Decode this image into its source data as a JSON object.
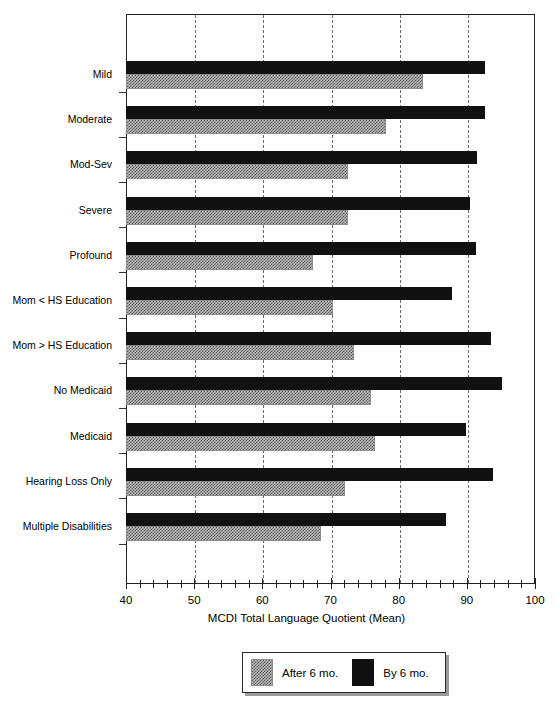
{
  "chart_data": {
    "type": "bar",
    "orientation": "horizontal",
    "title": "",
    "xlabel": "MCDI Total Language Quotient (Mean)",
    "ylabel": "",
    "xlim": [
      40,
      100
    ],
    "xticks": [
      40,
      50,
      60,
      70,
      80,
      90,
      100
    ],
    "xtick_labels": [
      "40",
      "50",
      "60",
      "70",
      "80",
      "90",
      "100"
    ],
    "minor_tick_step": 2,
    "grid": "vertical dashed at 50,60,70,80,90",
    "gridlines": [
      50,
      60,
      70,
      80,
      90
    ],
    "legend_position": "bottom-center",
    "categories": [
      "Mild",
      "Moderate",
      "Mod-Sev",
      "Severe",
      "Profound",
      "Mom < HS Education",
      "Mom > HS Education",
      "No Medicaid",
      "Medicaid",
      "Hearing Loss Only",
      "Multiple Disabilities"
    ],
    "series": [
      {
        "name": "By 6 mo.",
        "color": "#111111",
        "values": [
          92.6,
          92.6,
          91.5,
          90.4,
          91.4,
          87.8,
          93.6,
          95.1,
          89.9,
          93.8,
          86.9
        ]
      },
      {
        "name": "After 6 mo.",
        "color": "#b9b9b9",
        "values": [
          83.5,
          78.1,
          72.5,
          72.6,
          67.4,
          70.3,
          73.4,
          75.9,
          76.6,
          72.2,
          68.6
        ]
      }
    ]
  },
  "legend": {
    "entries": [
      {
        "label": "After 6 mo.",
        "swatch": "gray-hatched"
      },
      {
        "label": "By 6 mo.",
        "swatch": "black"
      }
    ]
  },
  "axis": {
    "x_title": "MCDI Total Language Quotient (Mean)"
  }
}
